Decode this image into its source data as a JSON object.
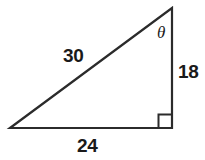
{
  "figure": {
    "kind": "right-triangle-diagram",
    "background_color": "#ffffff",
    "stroke_color": "#2b2b2b",
    "text_color": "#1a1a1a",
    "labels": {
      "hypotenuse": "30",
      "vertical_leg": "18",
      "base_leg": "24",
      "angle": "θ"
    },
    "geometry": {
      "left_vertex": [
        10,
        128
      ],
      "apex_vertex": [
        172,
        8
      ],
      "right_angle_vertex": [
        172,
        128
      ],
      "right_angle_marker_size": 13
    }
  }
}
